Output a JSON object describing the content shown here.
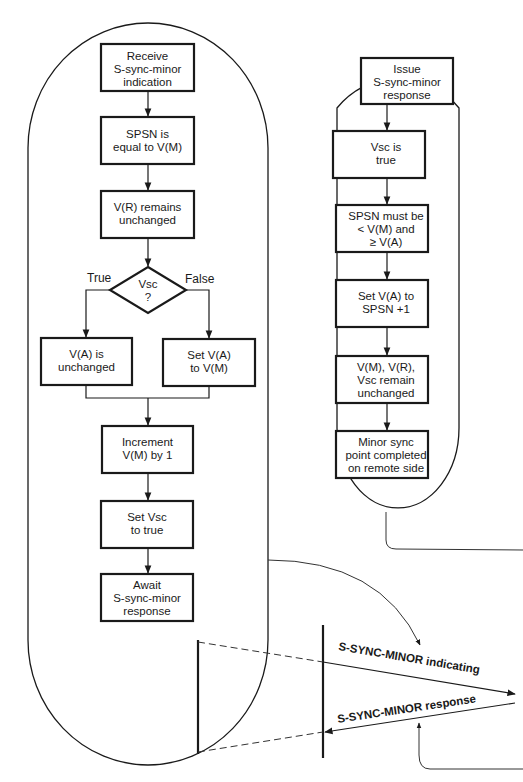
{
  "left_flow": {
    "steps": [
      {
        "lines": [
          "Receive",
          "S-sync-minor",
          "indication"
        ]
      },
      {
        "lines": [
          "SPSN is",
          "equal to V(M)"
        ]
      },
      {
        "lines": [
          "V(R) remains",
          "unchanged"
        ]
      }
    ],
    "decision": {
      "lines": [
        "Vsc",
        "?"
      ],
      "true_label": "True",
      "false_label": "False"
    },
    "branch_true": {
      "lines": [
        "V(A) is",
        "unchanged"
      ]
    },
    "branch_false": {
      "lines": [
        "Set V(A)",
        "to V(M)"
      ]
    },
    "after": [
      {
        "lines": [
          "Increment",
          "V(M) by 1"
        ]
      },
      {
        "lines": [
          "Set Vsc",
          "to true"
        ]
      },
      {
        "lines": [
          "Await",
          "S-sync-minor",
          "response"
        ]
      }
    ]
  },
  "right_flow": {
    "steps": [
      {
        "lines": [
          "Issue",
          "S-sync-minor",
          "response"
        ]
      },
      {
        "lines": [
          "Vsc is",
          "true"
        ]
      },
      {
        "lines": [
          "SPSN must be",
          "< V(M) and",
          "≥ V(A)"
        ]
      },
      {
        "lines": [
          "Set V(A) to",
          "SPSN +1"
        ]
      },
      {
        "lines": [
          "V(M), V(R),",
          "Vsc remain",
          "unchanged"
        ]
      },
      {
        "lines": [
          "Minor sync",
          "point completed",
          "on remote side"
        ]
      }
    ]
  },
  "timing": {
    "indication_label": "S-SYNC-MINOR indicating",
    "response_label": "S-SYNC-MINOR response"
  }
}
